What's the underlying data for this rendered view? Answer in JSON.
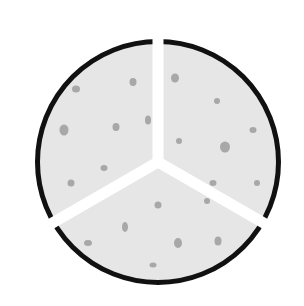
{
  "diagram": {
    "center": [
      158,
      162
    ],
    "outer_radius": 123,
    "border_width": 5,
    "gap_width": 11,
    "divider_angles_deg": [
      -90,
      150,
      30
    ],
    "colors": {
      "background": "#ffffff",
      "fill": "#e6e6e6",
      "border": "#111111",
      "gap": "#ffffff",
      "spot": "#9c9c9c"
    },
    "sectors": [
      {
        "name": "upper-left",
        "start_deg": 150,
        "end_deg": 270,
        "spots": [
          [
            76,
            89,
            4,
            3.5
          ],
          [
            133,
            82,
            3.5,
            4
          ],
          [
            64,
            130,
            4.5,
            5.5
          ],
          [
            116,
            127,
            3.5,
            4
          ],
          [
            148,
            120,
            3,
            4.5
          ],
          [
            104,
            168,
            3.5,
            3
          ],
          [
            71,
            183,
            3.5,
            3.5
          ]
        ]
      },
      {
        "name": "upper-right",
        "start_deg": 270,
        "end_deg": 390,
        "spots": [
          [
            175,
            78,
            4,
            4.5
          ],
          [
            217,
            101,
            3,
            3
          ],
          [
            253,
            130,
            3.5,
            3
          ],
          [
            179,
            141,
            3,
            3
          ],
          [
            225,
            147,
            5,
            5.5
          ],
          [
            213,
            183,
            3.5,
            3
          ],
          [
            257,
            183,
            3,
            3
          ]
        ]
      },
      {
        "name": "bottom",
        "start_deg": 30,
        "end_deg": 150,
        "spots": [
          [
            158,
            205,
            3.5,
            3.5
          ],
          [
            125,
            227,
            3,
            5
          ],
          [
            207,
            201,
            3,
            3
          ],
          [
            88,
            243,
            4,
            3
          ],
          [
            178,
            243,
            4,
            5
          ],
          [
            218,
            241,
            3.5,
            4.5
          ],
          [
            153,
            265,
            3.5,
            2.5
          ]
        ]
      }
    ]
  }
}
